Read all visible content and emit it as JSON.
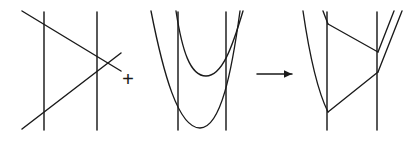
{
  "figure": {
    "background": "#ffffff",
    "stroke_color": "#1a1a1a",
    "width": 409,
    "height": 141,
    "operators": [
      {
        "symbol": "+",
        "name": "plus-operator",
        "x": 128,
        "y": 78
      },
      {
        "symbol": "→",
        "name": "arrow-operator",
        "x": 258,
        "y": 74
      }
    ],
    "panels": [
      {
        "name": "panel-left",
        "label": "line arrangement with two vertical lines and two crossing diagonals",
        "vertical_lines": [
          {
            "x": 44,
            "y1": 12,
            "y2": 130
          },
          {
            "x": 97,
            "y1": 12,
            "y2": 130
          }
        ],
        "diagonals": [
          {
            "name": "descending-diagonal",
            "x1": 22,
            "y1": 11,
            "x2": 121,
            "y2": 71
          },
          {
            "name": "ascending-diagonal",
            "x1": 22,
            "y1": 129,
            "x2": 121,
            "y2": 53
          }
        ],
        "crossing_point": {
          "x": 106,
          "y": 62
        }
      },
      {
        "name": "panel-middle",
        "label": "two parabolas with two vertical lines",
        "vertical_lines": [
          {
            "x": 178,
            "y1": 12,
            "y2": 130
          },
          {
            "x": 226,
            "y1": 12,
            "y2": 130
          }
        ],
        "curves": [
          {
            "name": "upper-parabola",
            "vertex": {
              "x": 206,
              "y": 76
            },
            "left_end": {
              "x": 176,
              "y": 11
            },
            "right_end": {
              "x": 243,
              "y": 11
            }
          },
          {
            "name": "lower-parabola",
            "vertex": {
              "x": 200,
              "y": 128
            },
            "left_end": {
              "x": 151,
              "y": 11
            },
            "right_end": {
              "x": 240,
              "y": 11
            }
          }
        ],
        "crossing_point": {
          "x": 231,
          "y": 68
        }
      },
      {
        "name": "panel-right",
        "label": "resulting tropical curve with two vertical lines and trivalent vertices",
        "vertical_lines": [
          {
            "x": 327,
            "y1": 12,
            "y2": 130
          },
          {
            "x": 377,
            "y1": 12,
            "y2": 130
          }
        ],
        "curve_vertices": [
          {
            "name": "bottom-vertex",
            "x": 328,
            "y": 112
          },
          {
            "name": "upper-right-vertex",
            "x": 377,
            "y": 52
          },
          {
            "name": "lower-right-vertex",
            "x": 377,
            "y": 72
          },
          {
            "name": "top-left-vertex",
            "x": 328,
            "y": 24
          }
        ],
        "edges": [
          {
            "name": "left-outer-arc",
            "from": {
              "x": 303,
              "y": 11
            },
            "to": {
              "x": 328,
              "y": 112
            }
          },
          {
            "name": "top-to-upper-right-edge",
            "from": {
              "x": 328,
              "y": 24
            },
            "to": {
              "x": 377,
              "y": 52
            }
          },
          {
            "name": "bottom-to-lower-right-edge",
            "from": {
              "x": 328,
              "y": 112
            },
            "to": {
              "x": 377,
              "y": 72
            }
          },
          {
            "name": "upper-right-ray",
            "from": {
              "x": 377,
              "y": 52
            },
            "to": {
              "x": 394,
              "y": 11
            }
          },
          {
            "name": "lower-right-ray",
            "from": {
              "x": 377,
              "y": 72
            },
            "to": {
              "x": 402,
              "y": 11
            }
          }
        ]
      }
    ]
  }
}
